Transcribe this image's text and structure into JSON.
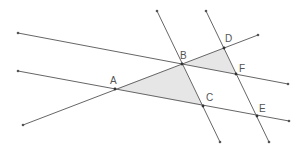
{
  "diagram": {
    "type": "geometry-parallel-lines-similar-triangles",
    "colors": {
      "line": "#666666",
      "shade": "#e6e6e6",
      "label": "#555555",
      "background": "#ffffff"
    },
    "points": [
      {
        "id": "A",
        "label": "A",
        "x": 115,
        "y": 89
      },
      {
        "id": "B",
        "label": "B",
        "x": 182,
        "y": 64
      },
      {
        "id": "C",
        "label": "C",
        "x": 203,
        "y": 106
      },
      {
        "id": "D",
        "label": "D",
        "x": 224,
        "y": 48
      },
      {
        "id": "F",
        "label": "F",
        "x": 236,
        "y": 74
      },
      {
        "id": "E",
        "label": "E",
        "x": 257,
        "y": 116
      }
    ],
    "lines": [
      {
        "name": "line-upper",
        "through": [
          "B",
          "F"
        ],
        "x1": 18,
        "y1": 33,
        "x2": 288,
        "y2": 84
      },
      {
        "name": "line-lower",
        "through": [
          "A",
          "C",
          "E"
        ],
        "x1": 18,
        "y1": 71,
        "x2": 289,
        "y2": 121
      },
      {
        "name": "line-transversal-ABD",
        "through": [
          "A",
          "B",
          "D"
        ],
        "x1": 23,
        "y1": 125,
        "x2": 258,
        "y2": 35
      },
      {
        "name": "line-BC",
        "through": [
          "B",
          "C"
        ],
        "x1": 157,
        "y1": 11,
        "x2": 220,
        "y2": 142
      },
      {
        "name": "line-DFE",
        "through": [
          "D",
          "F",
          "E"
        ],
        "x1": 206,
        "y1": 11,
        "x2": 269,
        "y2": 142
      }
    ],
    "shaded_triangles": [
      {
        "name": "triangle-ABC",
        "vertices": [
          "A",
          "B",
          "C"
        ]
      },
      {
        "name": "triangle-BDF",
        "vertices": [
          "B",
          "D",
          "F"
        ]
      }
    ]
  }
}
